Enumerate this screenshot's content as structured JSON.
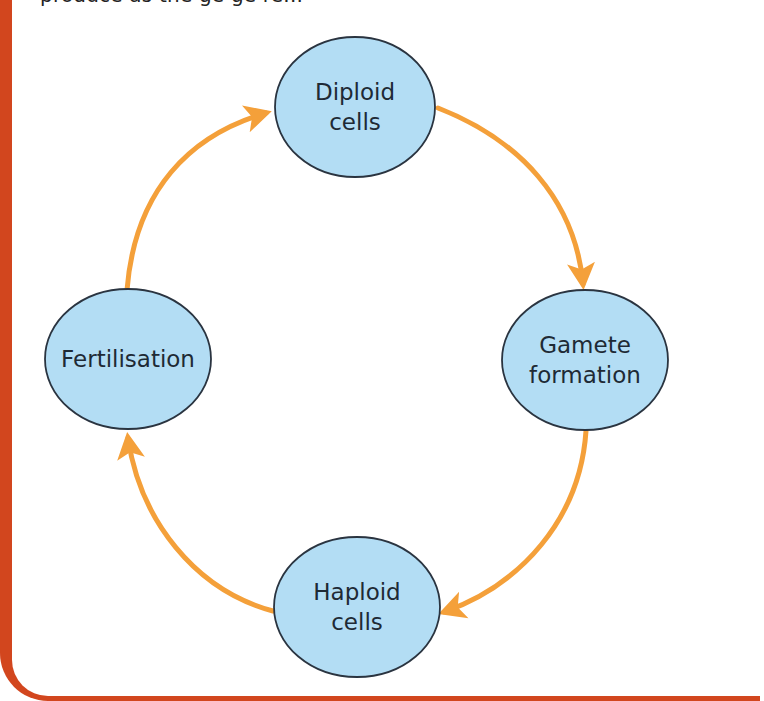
{
  "header": {
    "cutoff_text": "produce as the ge ge re..."
  },
  "colors": {
    "frame": "#D2461E",
    "node_fill": "#B3DDF4",
    "node_stroke": "#2a3440",
    "arrow": "#F4A03A",
    "text": "#1e2a35"
  },
  "diagram": {
    "nodes": [
      {
        "id": "diploid",
        "label": "Diploid\ncells",
        "cx": 355,
        "cy": 107,
        "rx": 81,
        "ry": 70
      },
      {
        "id": "gamete",
        "label": "Gamete\nformation",
        "cx": 585,
        "cy": 360,
        "rx": 83,
        "ry": 70
      },
      {
        "id": "haploid",
        "label": "Haploid\ncells",
        "cx": 357,
        "cy": 607,
        "rx": 83,
        "ry": 70
      },
      {
        "id": "fertilisation",
        "label": "Fertilisation",
        "cx": 128,
        "cy": 359,
        "rx": 83,
        "ry": 70
      }
    ],
    "edges": [
      {
        "from": "diploid",
        "to": "gamete"
      },
      {
        "from": "gamete",
        "to": "haploid"
      },
      {
        "from": "haploid",
        "to": "fertilisation"
      },
      {
        "from": "fertilisation",
        "to": "diploid"
      }
    ]
  }
}
